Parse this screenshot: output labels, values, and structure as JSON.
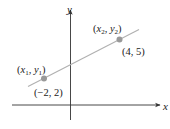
{
  "diagram": {
    "title": "",
    "axes": {
      "x_label": "x",
      "y_label": "y"
    },
    "line": {
      "description": "Line through two points",
      "color": "#b0b0b0"
    },
    "points": [
      {
        "symbolic": {
          "open": "(",
          "x": "x",
          "xsub": "1",
          "sep": ", ",
          "y": "y",
          "ysub": "1",
          "close": ")"
        },
        "coords": "(−2, 2)",
        "x": -2,
        "y": 2,
        "color": "#999999"
      },
      {
        "symbolic": {
          "open": "(",
          "x": "x",
          "xsub": "2",
          "sep": ", ",
          "y": "y",
          "ysub": "2",
          "close": ")"
        },
        "coords": "(4, 5)",
        "x": 4,
        "y": 5,
        "color": "#999999"
      }
    ],
    "colors": {
      "axis": "#333333",
      "line": "#b0b0b0",
      "point": "#999999",
      "text": "#222222"
    }
  }
}
